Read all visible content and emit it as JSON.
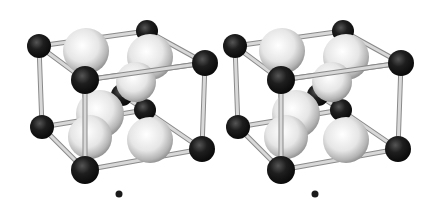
{
  "figure": {
    "type": "stereo-pair crystal structure",
    "panels": [
      "left-eye view",
      "right-eye view"
    ]
  },
  "colors": {
    "background": "#ffffff",
    "dark_atom": "#1a1a1a",
    "light_atom": "#f2f2f2",
    "bond": "#d8d8d8",
    "bond_edge": "#8a8a8a"
  },
  "legend_marker": "small dark dot below each cell",
  "atom_counts": {
    "dark_atoms_per_cell": 9,
    "light_atoms_per_cell": 6
  }
}
